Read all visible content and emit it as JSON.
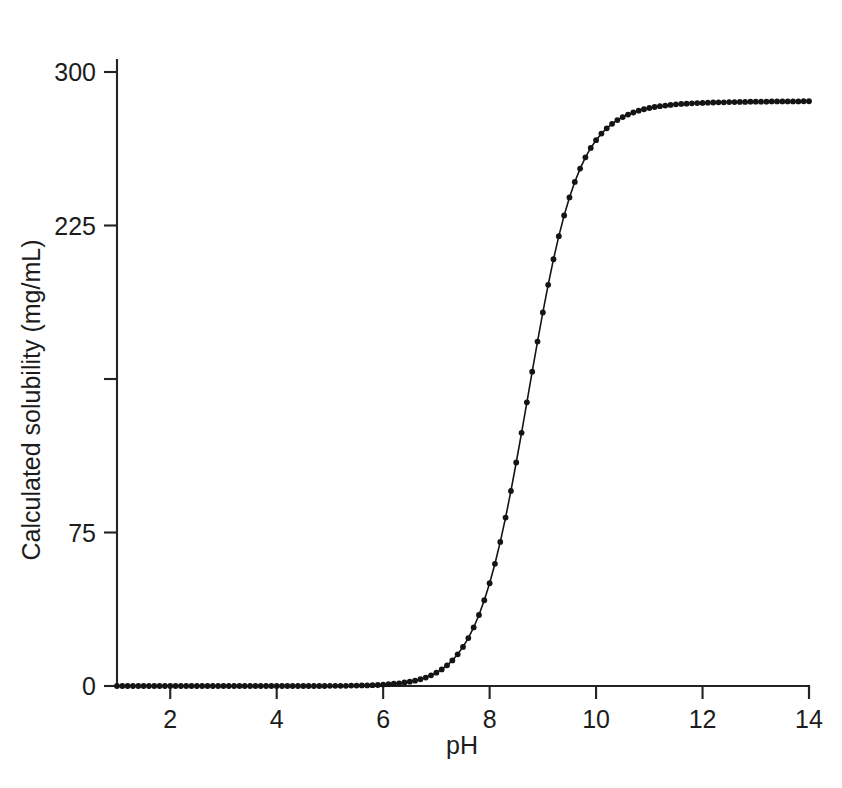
{
  "chart_data": {
    "type": "line",
    "title": "",
    "subtitle": "",
    "xlabel": "pH",
    "ylabel": "Calculated solubility (mg/mL)",
    "xlim": [
      1,
      14
    ],
    "ylim": [
      0,
      310
    ],
    "xticks": [
      2,
      4,
      6,
      8,
      10,
      12,
      14
    ],
    "xtick_labels": [
      "2",
      "4",
      "6",
      "8",
      "10",
      "12",
      "14"
    ],
    "yticks": [
      0,
      75,
      150,
      225,
      300
    ],
    "ytick_labels": [
      "0",
      "75",
      "225",
      "300"
    ],
    "ytick_labels_shown": [
      "0",
      "75",
      "225",
      "300"
    ],
    "grid": false,
    "legend": null,
    "marker": "filled-circle",
    "marker_size": 5,
    "line_color": "#141414",
    "marker_color": "#141414",
    "plateau_value": 290,
    "baseline_value": 0,
    "midpoint_ph": 8.1,
    "series": [
      {
        "name": "Calculated solubility",
        "x": [
          1.0,
          1.1,
          1.2,
          1.3,
          1.4,
          1.5,
          1.6,
          1.7,
          1.8,
          1.9,
          2.0,
          2.1,
          2.2,
          2.3,
          2.4,
          2.5,
          2.6,
          2.7,
          2.8,
          2.9,
          3.0,
          3.1,
          3.2,
          3.3,
          3.4,
          3.5,
          3.6,
          3.7,
          3.8,
          3.9,
          4.0,
          4.1,
          4.2,
          4.3,
          4.4,
          4.5,
          4.6,
          4.7,
          4.8,
          4.9,
          5.0,
          5.1,
          5.2,
          5.3,
          5.4,
          5.5,
          5.6,
          5.7,
          5.8,
          5.9,
          6.0,
          6.1,
          6.2,
          6.3,
          6.4,
          6.5,
          6.6,
          6.7,
          6.8,
          6.9,
          7.0,
          7.1,
          7.2,
          7.3,
          7.4,
          7.5,
          7.6,
          7.7,
          7.8,
          7.9,
          8.0,
          8.1,
          8.2,
          8.3,
          8.4,
          8.5,
          8.6,
          8.7,
          8.8,
          8.9,
          9.0,
          9.1,
          9.2,
          9.3,
          9.4,
          9.5,
          9.6,
          9.7,
          9.8,
          9.9,
          10.0,
          10.1,
          10.2,
          10.3,
          10.4,
          10.5,
          10.6,
          10.7,
          10.8,
          10.9,
          11.0,
          11.1,
          11.2,
          11.3,
          11.4,
          11.5,
          11.6,
          11.7,
          11.8,
          11.9,
          12.0,
          12.1,
          12.2,
          12.3,
          12.4,
          12.5,
          12.6,
          12.7,
          12.8,
          12.9,
          13.0,
          13.1,
          13.2,
          13.3,
          13.4,
          13.5,
          13.6,
          13.7,
          13.8,
          13.9,
          14.0
        ],
        "y": [
          0.0,
          0.0,
          0.0,
          0.0,
          0.0,
          0.0,
          0.0,
          0.0,
          0.0,
          0.0,
          0.0,
          0.0,
          0.0,
          0.0,
          0.0,
          0.0,
          0.0,
          0.0,
          0.0,
          0.0,
          0.0,
          0.0,
          0.0,
          0.0,
          0.0,
          0.0,
          0.0,
          0.0,
          0.0,
          0.0,
          0.0,
          0.0,
          0.0,
          0.0,
          0.0,
          0.0,
          0.0,
          0.0,
          0.0,
          0.0,
          0.1,
          0.1,
          0.1,
          0.1,
          0.2,
          0.2,
          0.3,
          0.3,
          0.4,
          0.5,
          0.7,
          0.9,
          1.1,
          1.3,
          1.7,
          2.1,
          2.6,
          3.3,
          4.1,
          5.2,
          6.5,
          8.1,
          10.1,
          12.5,
          15.5,
          19.1,
          23.4,
          28.6,
          34.7,
          41.9,
          50.2,
          59.7,
          70.4,
          82.3,
          95.3,
          109.2,
          123.7,
          138.6,
          153.6,
          168.3,
          182.5,
          196.0,
          208.5,
          219.8,
          229.9,
          238.7,
          246.3,
          252.8,
          258.3,
          262.9,
          266.7,
          269.9,
          272.5,
          274.7,
          276.5,
          278.0,
          279.2,
          280.2,
          281.1,
          281.8,
          282.4,
          282.9,
          283.3,
          283.6,
          283.9,
          284.2,
          284.4,
          284.5,
          284.7,
          284.8,
          284.9,
          285.0,
          285.1,
          285.2,
          285.2,
          285.3,
          285.3,
          285.4,
          285.4,
          285.5,
          285.5,
          285.5,
          285.5,
          285.6,
          285.6,
          285.6,
          285.6,
          285.6,
          285.6,
          285.7,
          285.7
        ]
      }
    ]
  },
  "axis": {
    "x_title": "pH",
    "y_title": "Calculated solubility (mg/mL)"
  }
}
